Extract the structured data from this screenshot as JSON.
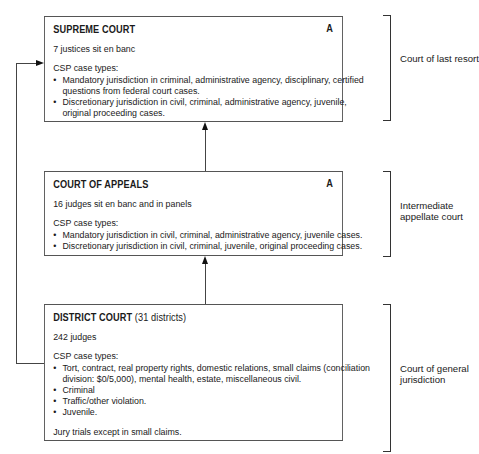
{
  "courts": {
    "supreme": {
      "title": "SUPREME COURT",
      "badge": "A",
      "desc": "7 justices sit en banc",
      "csp_label": "CSP case types:",
      "items": [
        "Mandatory jurisdiction in criminal, administrative agency, disciplinary, certified questions from federal court cases.",
        "Discretionary jurisdiction in civil, criminal, administrative agency, juvenile, original proceeding cases."
      ],
      "tier_label": "Court of last resort"
    },
    "appeals": {
      "title": "COURT OF APPEALS",
      "badge": "A",
      "desc": "16 judges sit en banc and in panels",
      "csp_label": "CSP case types:",
      "items": [
        "Mandatory jurisdiction in civil, criminal, administrative agency, juvenile cases.",
        "Discretionary jurisdiction in civil, criminal, juvenile, original proceeding cases."
      ],
      "tier_label": "Intermediate appellate court"
    },
    "district": {
      "title": "DISTRICT COURT",
      "subtitle": "(31 districts)",
      "desc": "242 judges",
      "csp_label": "CSP case types:",
      "items": [
        "Tort, contract, real property rights, domestic relations, small claims (conciliation division: $0/5,000), mental health, estate, miscellaneous civil.",
        "Criminal",
        "Traffic/other violation.",
        "Juvenile."
      ],
      "note": "Jury trials except in small claims.",
      "tier_label": "Court of general jurisdiction"
    }
  }
}
